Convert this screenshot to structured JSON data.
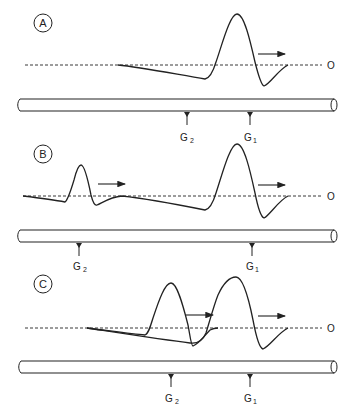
{
  "figure": {
    "panels": [
      {
        "id": "A",
        "label": "A",
        "zero_label": "O",
        "electrodes": [
          {
            "name": "G",
            "sub": "2"
          },
          {
            "name": "G",
            "sub": "1"
          }
        ]
      },
      {
        "id": "B",
        "label": "B",
        "zero_label": "O",
        "electrodes": [
          {
            "name": "G",
            "sub": "2"
          },
          {
            "name": "G",
            "sub": "1"
          }
        ]
      },
      {
        "id": "C",
        "label": "C",
        "zero_label": "O",
        "electrodes": [
          {
            "name": "G",
            "sub": "2"
          },
          {
            "name": "G",
            "sub": "1"
          }
        ]
      }
    ],
    "colors": {
      "line": "#222222",
      "background": "#ffffff"
    }
  }
}
